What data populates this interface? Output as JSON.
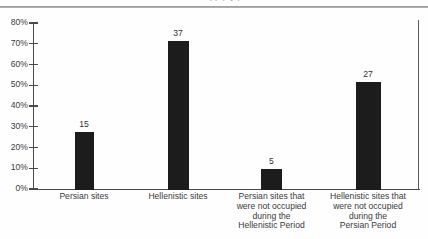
{
  "figure": {
    "cutoff_title_fragment": "pp     p          y p",
    "axis_color": "#4a4a4a",
    "bar_color": "#1c1c1c",
    "text_color": "#3a3a3a",
    "rule_color": "#8e8e8e"
  },
  "chart_data": {
    "type": "bar",
    "title": "",
    "xlabel": "",
    "ylabel": "",
    "ylim": [
      0,
      85
    ],
    "grid": false,
    "legend": null,
    "ytick_labels": [
      "0%",
      "10%",
      "20%",
      "30%",
      "40%",
      "50%",
      "60%",
      "70%",
      "80%"
    ],
    "ytick_values": [
      0,
      10,
      20,
      30,
      40,
      50,
      60,
      70,
      80
    ],
    "categories": [
      "Persian sites",
      "Hellenistic sites",
      "Persian sites that were not occupied during the Hellenistic Period",
      "Hellenistic sites that were not occupied during the Persian Period"
    ],
    "category_lines": [
      [
        "Persian sites"
      ],
      [
        "Hellenistic sites"
      ],
      [
        "Persian sites that",
        "were not occupied",
        "during the",
        "Hellenistic Period"
      ],
      [
        "Hellenistic sites that",
        "were not occupied",
        "during the",
        "Persian Period"
      ]
    ],
    "data_labels": [
      "15",
      "37",
      "5",
      "27"
    ],
    "counts": [
      15,
      37,
      5,
      27
    ],
    "values": [
      28,
      72,
      10,
      52
    ],
    "value_unit": "percent"
  }
}
